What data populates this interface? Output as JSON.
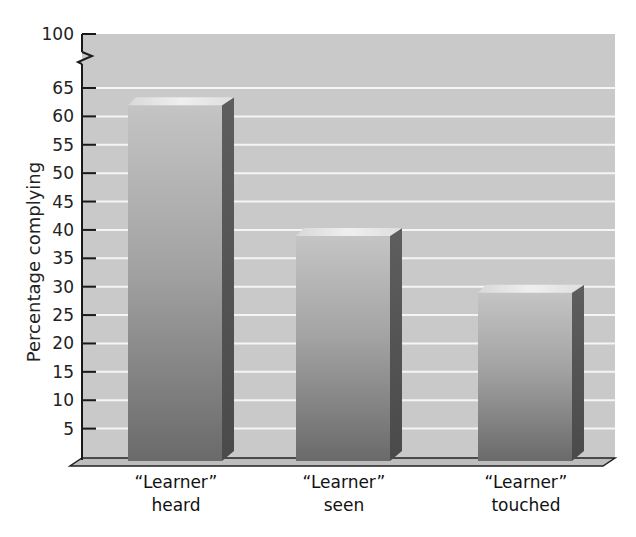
{
  "chart_data": {
    "type": "bar",
    "title": "",
    "xlabel": "",
    "ylabel": "Percentage complying",
    "categories": [
      "“Learner” heard",
      "“Learner” seen",
      "“Learner” touched"
    ],
    "category_lines": [
      [
        "“Learner”",
        "heard"
      ],
      [
        "“Learner”",
        "seen"
      ],
      [
        "“Learner”",
        "touched"
      ]
    ],
    "values": [
      63,
      40,
      30
    ],
    "ylim": [
      0,
      100
    ],
    "yticks": [
      5,
      10,
      15,
      20,
      25,
      30,
      35,
      40,
      45,
      50,
      55,
      60,
      65,
      100
    ],
    "axis_break": {
      "from": 65,
      "to": 100
    },
    "grid": true,
    "style": "3d-bar",
    "colors": {
      "background": "#c9c9c9",
      "gridline": "#f4f4f4",
      "bar_front_top": "#bdbdbd",
      "bar_front_bottom": "#6e6e6e",
      "bar_side": "#555555",
      "bar_top": "#e6e6e6",
      "axis": "#1a1a1a"
    }
  },
  "axis": {
    "ylabel": "Percentage complying",
    "tick_labels": [
      "100",
      "65",
      "60",
      "55",
      "50",
      "45",
      "40",
      "35",
      "30",
      "25",
      "20",
      "15",
      "10",
      "5"
    ]
  },
  "labels": {
    "bar1_line1": "“Learner”",
    "bar1_line2": "heard",
    "bar2_line1": "“Learner”",
    "bar2_line2": "seen",
    "bar3_line1": "“Learner”",
    "bar3_line2": "touched"
  }
}
